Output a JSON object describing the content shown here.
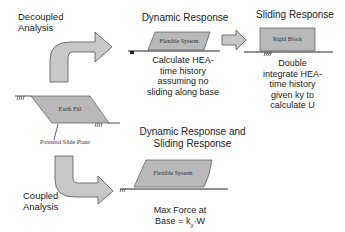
{
  "colors": {
    "shape_fill": "#b9b9b9",
    "shape_stroke": "#555555",
    "arrow_fill": "#c8c8c8",
    "line": "#222222",
    "background": "#ffffff"
  },
  "decoupled": {
    "label_line1": "Decoupled",
    "label_line2": "Analysis",
    "dynamic_response": {
      "title": "Dynamic Response",
      "system_label": "Flexible System",
      "note_lines": [
        "Calculate HEA-",
        "time history",
        "assuming no",
        "sliding along base"
      ]
    },
    "sliding_response": {
      "title": "Sliding Response",
      "block_label": "Rigid Block",
      "note_lines": [
        "Double",
        "integrate HEA-",
        "time history",
        "given ky to",
        "calculate U"
      ]
    }
  },
  "earth_fill": {
    "label": "Earth Fill",
    "slide_plane_label": "Potential Slide Plane"
  },
  "coupled": {
    "label_line1": "Coupled",
    "label_line2": "Analysis",
    "title_line1": "Dynamic Response and",
    "title_line2": "Sliding Response",
    "system_label": "Flexible System",
    "note_line1": "Max Force at",
    "note_line2_prefix": "Base = k",
    "note_line2_sub": "y",
    "note_line2_suffix": "·W"
  }
}
